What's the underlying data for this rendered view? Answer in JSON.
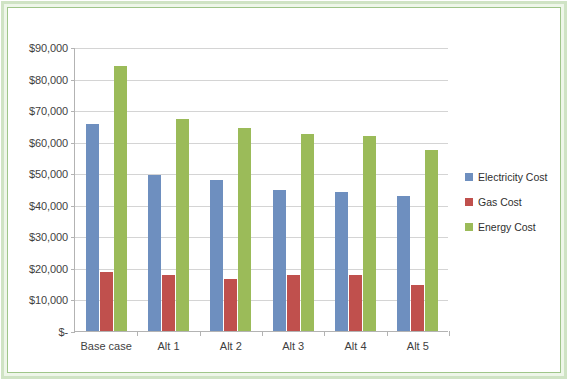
{
  "chart_data": {
    "type": "bar",
    "title": "",
    "xlabel": "",
    "ylabel": "",
    "ylim": [
      0,
      90000
    ],
    "grid": true,
    "legend_position": "right",
    "categories": [
      "Base case",
      "Alt 1",
      "Alt 2",
      "Alt 3",
      "Alt 4",
      "Alt 5"
    ],
    "ytick_labels": [
      "$90,000",
      "$80,000",
      "$70,000",
      "$60,000",
      "$50,000",
      "$40,000",
      "$30,000",
      "$20,000",
      "$10,000",
      "$-"
    ],
    "ytick_values": [
      90000,
      80000,
      70000,
      60000,
      50000,
      40000,
      30000,
      20000,
      10000,
      0
    ],
    "series": [
      {
        "name": "Electricity Cost",
        "color": "#6E8FBF",
        "values": [
          65500,
          49400,
          47800,
          44700,
          44100,
          42700
        ]
      },
      {
        "name": "Gas Cost",
        "color": "#C0504D",
        "values": [
          18800,
          17900,
          16500,
          17700,
          17900,
          14600
        ]
      },
      {
        "name": "Energy Cost",
        "color": "#9BBB59",
        "values": [
          84000,
          67200,
          64200,
          62400,
          61700,
          57300
        ]
      }
    ]
  },
  "legend": {
    "items": [
      {
        "label": "Electricity Cost",
        "color": "#6E8FBF"
      },
      {
        "label": "Gas Cost",
        "color": "#C0504D"
      },
      {
        "label": "Energy Cost",
        "color": "#9BBB59"
      }
    ]
  },
  "frame": {
    "outer_border_color": "#cfe3c4",
    "inner_border_color": "#9fc58a",
    "background_color": "#ffffff"
  }
}
